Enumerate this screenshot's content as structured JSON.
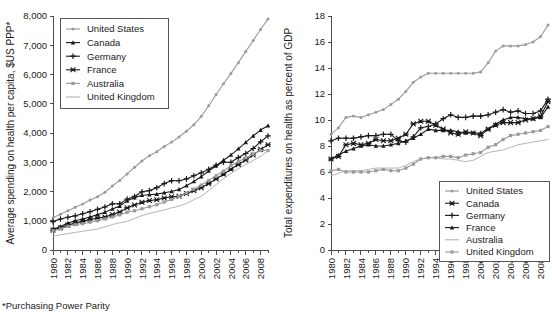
{
  "footnote": "*Purchasing Power Parity",
  "chart_data": [
    {
      "id": "left",
      "type": "line",
      "title": "",
      "xlabel": "",
      "ylabel": "Average spending on health per capita, $US PPP*",
      "xlim": [
        1980,
        2009
      ],
      "ylim": [
        0,
        8000
      ],
      "yticks": [
        0,
        1000,
        2000,
        3000,
        4000,
        5000,
        6000,
        7000,
        8000
      ],
      "ytick_labels": [
        "0",
        "1,000",
        "2,000",
        "3,000",
        "4,000",
        "5,000",
        "6,000",
        "7,000",
        "8,000"
      ],
      "xticks": [
        1980,
        1982,
        1984,
        1986,
        1988,
        1990,
        1992,
        1994,
        1996,
        1998,
        2000,
        2002,
        2004,
        2006,
        2008
      ],
      "xtick_labels": [
        "1980",
        "1982",
        "1984",
        "1986",
        "1988",
        "1990",
        "1992",
        "1994",
        "1996",
        "1998",
        "2000",
        "2002",
        "2004",
        "2006",
        "2008"
      ],
      "grid": false,
      "legend_position": "top-left",
      "x": [
        1980,
        1981,
        1982,
        1983,
        1984,
        1985,
        1986,
        1987,
        1988,
        1989,
        1990,
        1991,
        1992,
        1993,
        1994,
        1995,
        1996,
        1997,
        1998,
        1999,
        2000,
        2001,
        2002,
        2003,
        2004,
        2005,
        2006,
        2007,
        2008,
        2009
      ],
      "series": [
        {
          "name": "United States",
          "color": "#9a9a9a",
          "marker": "dot",
          "values": [
            1102,
            1219,
            1343,
            1459,
            1575,
            1711,
            1819,
            1974,
            2186,
            2379,
            2602,
            2830,
            3042,
            3225,
            3361,
            3537,
            3689,
            3865,
            4059,
            4283,
            4570,
            4930,
            5318,
            5682,
            6038,
            6405,
            6790,
            7160,
            7540,
            7900
          ]
        },
        {
          "name": "Canada",
          "color": "#1a1a1a",
          "marker": "triangle",
          "values": [
            710,
            800,
            920,
            1000,
            1060,
            1130,
            1210,
            1290,
            1400,
            1500,
            1680,
            1790,
            1870,
            1890,
            1910,
            1960,
            2000,
            2070,
            2200,
            2340,
            2510,
            2700,
            2880,
            3070,
            3250,
            3460,
            3680,
            3900,
            4100,
            4250
          ]
        },
        {
          "name": "Germany",
          "color": "#1a1a1a",
          "marker": "plus",
          "values": [
            970,
            1060,
            1120,
            1170,
            1240,
            1310,
            1390,
            1470,
            1580,
            1580,
            1740,
            1830,
            1990,
            2030,
            2130,
            2270,
            2370,
            2370,
            2430,
            2540,
            2640,
            2760,
            2900,
            3000,
            3000,
            3160,
            3300,
            3470,
            3700,
            3900
          ]
        },
        {
          "name": "France",
          "color": "#1a1a1a",
          "marker": "x",
          "values": [
            680,
            760,
            850,
            920,
            980,
            1040,
            1090,
            1130,
            1210,
            1300,
            1440,
            1540,
            1630,
            1690,
            1720,
            1780,
            1820,
            1840,
            1930,
            2030,
            2130,
            2270,
            2430,
            2590,
            2760,
            2920,
            3080,
            3250,
            3440,
            3600
          ]
        },
        {
          "name": "Australia",
          "color": "#9a9a9a",
          "marker": "square",
          "values": [
            660,
            720,
            810,
            870,
            900,
            950,
            1000,
            1060,
            1130,
            1200,
            1290,
            1340,
            1410,
            1480,
            1550,
            1640,
            1730,
            1830,
            1950,
            2080,
            2220,
            2380,
            2540,
            2700,
            2880,
            3020,
            3150,
            3280,
            3400,
            3400
          ]
        },
        {
          "name": "United Kingdom",
          "color": "#b5b5b5",
          "marker": "none",
          "values": [
            470,
            520,
            560,
            600,
            640,
            680,
            720,
            790,
            870,
            930,
            980,
            1080,
            1180,
            1250,
            1310,
            1370,
            1440,
            1500,
            1590,
            1720,
            1840,
            2030,
            2240,
            2440,
            2620,
            2780,
            2920,
            3060,
            3200,
            3400
          ]
        }
      ]
    },
    {
      "id": "right",
      "type": "line",
      "title": "",
      "xlabel": "",
      "ylabel": "Total expenditures on health as percent of GDP",
      "xlim": [
        1980,
        2009
      ],
      "ylim": [
        0,
        18
      ],
      "yticks": [
        0,
        2,
        4,
        6,
        8,
        10,
        12,
        14,
        16,
        18
      ],
      "ytick_labels": [
        "0",
        "2",
        "4",
        "6",
        "8",
        "10",
        "12",
        "14",
        "16",
        "18"
      ],
      "xticks": [
        1980,
        1982,
        1984,
        1986,
        1988,
        1990,
        1992,
        1994,
        1996,
        1998,
        2000,
        2002,
        2004,
        2006,
        2008
      ],
      "xtick_labels": [
        "1980",
        "1982",
        "1984",
        "1986",
        "1988",
        "1990",
        "1992",
        "1994",
        "1996",
        "1998",
        "2000",
        "2002",
        "2004",
        "2006",
        "2008"
      ],
      "grid": false,
      "legend_position": "bottom-right",
      "x": [
        1980,
        1981,
        1982,
        1983,
        1984,
        1985,
        1986,
        1987,
        1988,
        1989,
        1990,
        1991,
        1992,
        1993,
        1994,
        1995,
        1996,
        1997,
        1998,
        1999,
        2000,
        2001,
        2002,
        2003,
        2004,
        2005,
        2006,
        2007,
        2008,
        2009
      ],
      "series": [
        {
          "name": "United States",
          "color": "#9a9a9a",
          "marker": "dot",
          "values": [
            8.9,
            9.4,
            10.2,
            10.3,
            10.2,
            10.4,
            10.6,
            10.8,
            11.2,
            11.6,
            12.2,
            12.9,
            13.3,
            13.6,
            13.6,
            13.6,
            13.6,
            13.6,
            13.6,
            13.6,
            13.7,
            14.4,
            15.3,
            15.7,
            15.7,
            15.7,
            15.8,
            16.0,
            16.4,
            17.3
          ]
        },
        {
          "name": "Canada",
          "color": "#1a1a1a",
          "marker": "x",
          "values": [
            7.0,
            7.2,
            8.1,
            8.2,
            8.1,
            8.2,
            8.5,
            8.4,
            8.4,
            8.6,
            8.9,
            9.7,
            9.9,
            9.9,
            9.6,
            9.3,
            9.0,
            8.9,
            9.1,
            9.0,
            8.8,
            9.3,
            9.6,
            9.8,
            9.8,
            9.8,
            10.0,
            10.1,
            10.3,
            11.4
          ]
        },
        {
          "name": "Germany",
          "color": "#1a1a1a",
          "marker": "plus",
          "values": [
            8.4,
            8.6,
            8.6,
            8.6,
            8.7,
            8.8,
            8.8,
            8.9,
            8.9,
            8.4,
            8.3,
            8.7,
            9.4,
            9.5,
            9.7,
            10.1,
            10.4,
            10.2,
            10.2,
            10.3,
            10.3,
            10.4,
            10.6,
            10.8,
            10.6,
            10.7,
            10.5,
            10.5,
            10.7,
            11.6
          ]
        },
        {
          "name": "France",
          "color": "#1a1a1a",
          "marker": "triangle",
          "values": [
            7.0,
            7.3,
            7.6,
            7.8,
            8.0,
            8.1,
            8.0,
            8.0,
            8.1,
            8.2,
            8.4,
            8.6,
            8.9,
            9.3,
            9.2,
            9.2,
            9.2,
            9.1,
            9.0,
            9.0,
            9.0,
            9.3,
            9.7,
            10.0,
            10.2,
            10.2,
            10.1,
            10.1,
            10.2,
            11.0
          ]
        },
        {
          "name": "Australia",
          "color": "#b5b5b5",
          "marker": "none",
          "values": [
            5.7,
            5.9,
            6.1,
            6.1,
            6.1,
            6.2,
            6.3,
            6.3,
            6.3,
            6.3,
            6.5,
            6.8,
            7.0,
            7.1,
            7.1,
            7.0,
            7.0,
            6.9,
            6.8,
            6.9,
            7.2,
            7.5,
            7.6,
            7.7,
            7.9,
            8.1,
            8.2,
            8.3,
            8.4,
            8.5
          ]
        },
        {
          "name": "United Kingdom",
          "color": "#9a9a9a",
          "marker": "square",
          "values": [
            6.1,
            6.2,
            6.0,
            6.0,
            6.0,
            6.0,
            6.1,
            6.2,
            6.1,
            6.1,
            6.3,
            6.6,
            7.0,
            7.1,
            7.1,
            7.2,
            7.2,
            7.1,
            7.3,
            7.4,
            7.5,
            7.9,
            8.1,
            8.5,
            8.8,
            8.9,
            9.0,
            9.1,
            9.2,
            9.5
          ]
        }
      ]
    }
  ]
}
